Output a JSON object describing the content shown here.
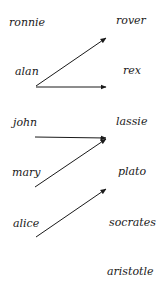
{
  "diagram": {
    "type": "mapping",
    "domain_labels": [
      {
        "name": "ronnie",
        "x": 9,
        "y": 17
      },
      {
        "name": "alan",
        "x": 15,
        "y": 66
      },
      {
        "name": "john",
        "x": 13,
        "y": 117
      },
      {
        "name": "mary",
        "x": 12,
        "y": 167
      },
      {
        "name": "alice",
        "x": 13,
        "y": 218
      }
    ],
    "codomain_labels": [
      {
        "name": "rover",
        "x": 116,
        "y": 15
      },
      {
        "name": "rex",
        "x": 123,
        "y": 65
      },
      {
        "name": "lassie",
        "x": 116,
        "y": 116
      },
      {
        "name": "plato",
        "x": 118,
        "y": 166
      },
      {
        "name": "socrates",
        "x": 109,
        "y": 217
      },
      {
        "name": "aristotle",
        "x": 107,
        "y": 266
      }
    ],
    "arrows": [
      {
        "from": "alan",
        "to": "rover",
        "x1": 36,
        "y1": 86,
        "x2": 106,
        "y2": 38
      },
      {
        "from": "alan",
        "to": "rex",
        "x1": 36,
        "y1": 87,
        "x2": 106,
        "y2": 87
      },
      {
        "from": "john",
        "to": "lassie",
        "x1": 35,
        "y1": 137,
        "x2": 106,
        "y2": 138
      },
      {
        "from": "mary",
        "to": "lassie",
        "x1": 35,
        "y1": 187,
        "x2": 106,
        "y2": 139
      },
      {
        "from": "alice",
        "to": "plato",
        "x1": 36,
        "y1": 237,
        "x2": 106,
        "y2": 189
      }
    ],
    "colors": {
      "arrow": "#1a1a1a",
      "text": "#1a1a1a",
      "background": "#ffffff"
    }
  }
}
